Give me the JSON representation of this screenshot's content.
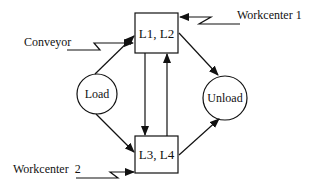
{
  "diagram": {
    "nodes": {
      "top_box": {
        "label": "L1, L2",
        "shape": "rectangle"
      },
      "bottom_box": {
        "label": "L3, L4",
        "shape": "rectangle"
      },
      "load": {
        "label": "Load",
        "shape": "circle"
      },
      "unload": {
        "label": "Unload",
        "shape": "circle"
      }
    },
    "inputs": {
      "conveyor": {
        "label": "Conveyor",
        "target": "L1, L2"
      },
      "workcenter1": {
        "label": "Workcenter 1",
        "target": "L1, L2"
      },
      "workcenter2": {
        "label": "Workcenter  2",
        "target": "L3, L4"
      }
    },
    "edges": [
      {
        "from": "Load",
        "to": "L1, L2"
      },
      {
        "from": "Load",
        "to": "L3, L4"
      },
      {
        "from": "L1, L2",
        "to": "L3, L4"
      },
      {
        "from": "L3, L4",
        "to": "L1, L2"
      },
      {
        "from": "L1, L2",
        "to": "Unload"
      },
      {
        "from": "L3, L4",
        "to": "Unload"
      }
    ],
    "colors": {
      "stroke": "#111111",
      "background": "#ffffff"
    }
  }
}
